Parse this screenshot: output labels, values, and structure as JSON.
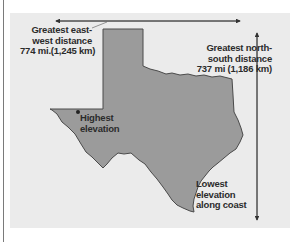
{
  "figure": {
    "colors": {
      "panel": "#ebebeb",
      "land": "#9b9b9b",
      "outline": "#4a4a4a",
      "arrow": "#333333",
      "text": "#2b2b2b"
    }
  },
  "annotations": {
    "east_west": {
      "lines": [
        "Greatest east-",
        "west distance",
        "774 mi.(1,245 km)"
      ]
    },
    "north_south": {
      "lines": [
        "Greatest north-",
        "south distance",
        "737 mi (1,186 km)"
      ]
    },
    "highest": {
      "lines": [
        "Highest",
        "elevation"
      ]
    },
    "lowest": {
      "lines": [
        "Lowest",
        "elevation",
        "along coast"
      ]
    }
  }
}
